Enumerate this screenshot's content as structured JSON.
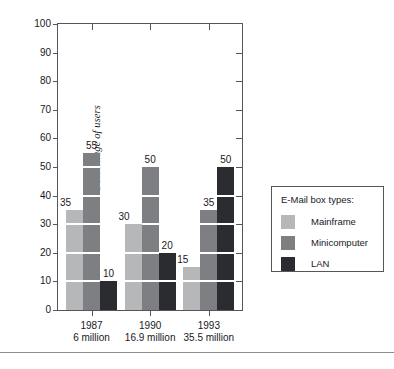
{
  "chart_data": {
    "type": "bar",
    "title": "",
    "subtitle": "",
    "xlabel": "",
    "ylabel": "Percentage of users",
    "ylim": [
      0,
      100
    ],
    "ytick_step": 10,
    "yticks": [
      0,
      10,
      20,
      30,
      40,
      50,
      60,
      70,
      80,
      90,
      100
    ],
    "ytick_labels": [
      "0",
      "10",
      "20",
      "30",
      "40",
      "50",
      "60",
      "70",
      "80",
      "90",
      "100"
    ],
    "grid": "white segment lines inside bars every 10 units",
    "legend_position": "right outside",
    "categories": [
      "1987",
      "1990",
      "1993"
    ],
    "category_sublabels": [
      "6 million",
      "16.9 million",
      "35.5 million"
    ],
    "series": [
      {
        "name": "Mainframe",
        "color": "#b6b7b9",
        "values": [
          35,
          30,
          15
        ]
      },
      {
        "name": "Minicomputer",
        "color": "#7e7f83",
        "values": [
          55,
          50,
          35
        ]
      },
      {
        "name": "LAN",
        "color": "#2b2c30",
        "values": [
          10,
          20,
          50
        ]
      }
    ],
    "data_labels": [
      {
        "category": "1987",
        "series": "Mainframe",
        "value": 35
      },
      {
        "category": "1987",
        "series": "Minicomputer",
        "value": 55
      },
      {
        "category": "1987",
        "series": "LAN",
        "value": 10
      },
      {
        "category": "1990",
        "series": "Mainframe",
        "value": 30
      },
      {
        "category": "1990",
        "series": "Minicomputer",
        "value": 50
      },
      {
        "category": "1990",
        "series": "LAN",
        "value": 20
      },
      {
        "category": "1993",
        "series": "Mainframe",
        "value": 15
      },
      {
        "category": "1993",
        "series": "Minicomputer",
        "value": 35
      },
      {
        "category": "1993",
        "series": "LAN",
        "value": 50
      }
    ]
  },
  "axis": {
    "y_title": "Percentage of users",
    "y_labels": [
      "100",
      "90",
      "80",
      "70",
      "60",
      "50",
      "40",
      "30",
      "20",
      "10",
      "0"
    ],
    "x_groups": [
      {
        "year": "1987",
        "users": "6 million"
      },
      {
        "year": "1990",
        "users": "16.9 million"
      },
      {
        "year": "1993",
        "users": "35.5 million"
      }
    ]
  },
  "legend": {
    "title": "E-Mail box types:",
    "items": [
      {
        "label": "Mainframe",
        "color": "#b6b7b9"
      },
      {
        "label": "Minicomputer",
        "color": "#7e7f83"
      },
      {
        "label": "LAN",
        "color": "#2b2c30"
      }
    ]
  },
  "footer": {
    "caption": ""
  },
  "colors": {
    "mainframe": "#b6b7b9",
    "minicomputer": "#7e7f83",
    "lan": "#2b2c30",
    "frame": "#55565a",
    "text": "#18191c"
  }
}
